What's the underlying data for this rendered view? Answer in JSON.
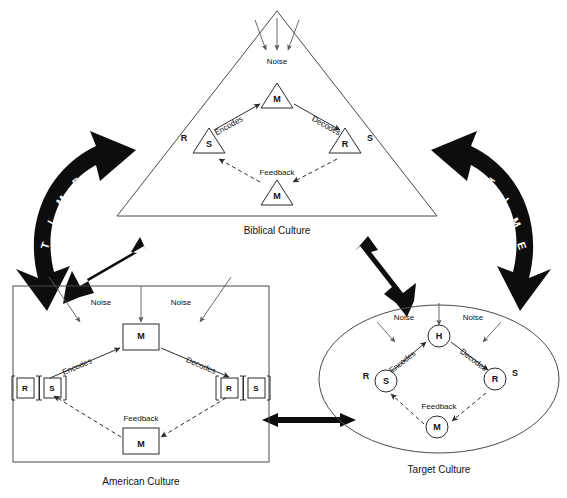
{
  "time_arrows": {
    "left": {
      "name": "TIME",
      "letters": [
        "T",
        "I",
        "M",
        "E"
      ]
    },
    "right": {
      "name": "TIME",
      "letters": [
        "T",
        "I",
        "M",
        "E"
      ]
    }
  },
  "cultures": [
    {
      "id": "biblical",
      "caption": "Biblical Culture",
      "shape": "triangle",
      "noise": {
        "label": "Noise",
        "arrow_count": 3
      },
      "nodes": {
        "top": {
          "inner": "M",
          "outer": ""
        },
        "left": {
          "inner": "S",
          "outer": "R"
        },
        "right": {
          "inner": "R",
          "outer": "S"
        },
        "bottom": {
          "inner": "M",
          "outer": ""
        }
      },
      "edges": {
        "encodes": "Encodes",
        "decodes": "Decodes",
        "feedback": "Feedback"
      }
    },
    {
      "id": "american",
      "caption": "American Culture",
      "shape": "rectangle",
      "noise": {
        "label": "Noise",
        "labels": [
          "Noise",
          "Noise"
        ],
        "arrow_count": 3
      },
      "nodes": {
        "top": {
          "inner": "M",
          "outer": ""
        },
        "left": {
          "inner": "S",
          "outer": "R"
        },
        "right": {
          "inner": "R",
          "outer": "S"
        },
        "bottom": {
          "inner": "M",
          "outer": ""
        }
      },
      "edges": {
        "encodes": "Encodes",
        "decodes": "Decodes",
        "feedback": "Feedback"
      }
    },
    {
      "id": "target",
      "caption": "Target Culture",
      "shape": "ellipse",
      "noise": {
        "label": "Noise",
        "labels": [
          "Noise",
          "Noise"
        ],
        "arrow_count": 3
      },
      "nodes": {
        "top": {
          "inner": "H",
          "outer": ""
        },
        "left": {
          "inner": "S",
          "outer": "R"
        },
        "right": {
          "inner": "R",
          "outer": "S"
        },
        "bottom": {
          "inner": "M",
          "outer": ""
        }
      },
      "edges": {
        "encodes": "Encodes",
        "decodes": "Decodes",
        "feedback": "Feedback"
      }
    }
  ],
  "connectors": [
    {
      "id": "biblical-american",
      "style": "double-headed-thick"
    },
    {
      "id": "biblical-target",
      "style": "double-headed-thick"
    },
    {
      "id": "american-target",
      "style": "double-headed-thick"
    }
  ],
  "colors": {
    "ink": "#111111",
    "outline": "#4a4a4a",
    "solid_black": "#0d0d0d",
    "background": "#ffffff"
  }
}
